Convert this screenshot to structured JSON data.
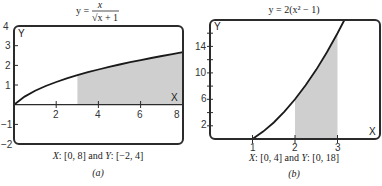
{
  "figure": {
    "panels": [
      {
        "id": "a",
        "title": {
          "prefix": "y =",
          "numerator": "x",
          "denominator": "√x + 1"
        },
        "y_axis_label": "Y",
        "x_axis_label": "X",
        "y_tick_labels": [
          "4",
          "3",
          "2",
          "1",
          "−1",
          "−2"
        ],
        "x_tick_labels": [
          "2",
          "4",
          "6",
          "8"
        ],
        "caption": {
          "x_var": "X",
          "x_range": ": [0, 8] and ",
          "y_var": "Y",
          "y_range": ": [−2, 4]"
        },
        "sublabel": "(a)"
      },
      {
        "id": "b",
        "title": {
          "text": "y = 2(x² − 1)"
        },
        "y_axis_label": "Y",
        "x_axis_label": "X",
        "y_tick_labels": [
          "14",
          "10",
          "6",
          "2"
        ],
        "x_tick_labels": [
          "1",
          "2",
          "3"
        ],
        "caption": {
          "x_var": "X",
          "x_range": ": [0, 4] and ",
          "y_var": "Y",
          "y_range": ": [0, 18]"
        },
        "sublabel": "(b)"
      }
    ]
  },
  "colors": {
    "curve": "#1a1a1a",
    "shade": "#cfcfcf",
    "frame": "#2b2b2b"
  },
  "chart_data": [
    {
      "type": "line",
      "title": "y = x / √(x + 1)",
      "xlabel": "X",
      "ylabel": "Y",
      "xlim": [
        0,
        8
      ],
      "ylim": [
        -2,
        4
      ],
      "x_ticks": [
        2,
        4,
        6,
        8
      ],
      "y_ticks": [
        -2,
        -1,
        1,
        2,
        3,
        4
      ],
      "grid": false,
      "shaded_region": {
        "x_from": 3,
        "x_to": 8,
        "between": "curve and x-axis"
      },
      "series": [
        {
          "name": "y = x/√(x+1)",
          "x": [
            0,
            0.5,
            1,
            1.5,
            2,
            2.5,
            3,
            3.5,
            4,
            4.5,
            5,
            5.5,
            6,
            6.5,
            7,
            7.5,
            8
          ],
          "y": [
            0,
            0.408,
            0.707,
            0.949,
            1.155,
            1.336,
            1.5,
            1.65,
            1.789,
            1.919,
            2.041,
            2.157,
            2.268,
            2.373,
            2.475,
            2.572,
            2.667
          ]
        }
      ],
      "caption": "X: [0, 8] and Y: [−2, 4]",
      "panel_label": "(a)"
    },
    {
      "type": "line",
      "title": "y = 2(x² − 1)",
      "xlabel": "X",
      "ylabel": "Y",
      "xlim": [
        0,
        4
      ],
      "ylim": [
        0,
        18
      ],
      "x_ticks": [
        1,
        2,
        3
      ],
      "y_ticks": [
        2,
        4,
        6,
        8,
        10,
        12,
        14,
        16
      ],
      "y_tick_labels_shown": [
        2,
        6,
        10,
        14
      ],
      "grid": false,
      "shaded_region": {
        "x_from": 2,
        "x_to": 3,
        "between": "curve and x-axis"
      },
      "series": [
        {
          "name": "y = 2(x²−1)",
          "x": [
            1,
            1.25,
            1.5,
            1.75,
            2,
            2.25,
            2.5,
            2.75,
            3,
            3.162
          ],
          "y": [
            0,
            1.125,
            2.5,
            4.125,
            6,
            8.125,
            10.5,
            13.125,
            16,
            18
          ]
        }
      ],
      "caption": "X: [0, 4] and Y: [0, 18]",
      "panel_label": "(b)"
    }
  ]
}
